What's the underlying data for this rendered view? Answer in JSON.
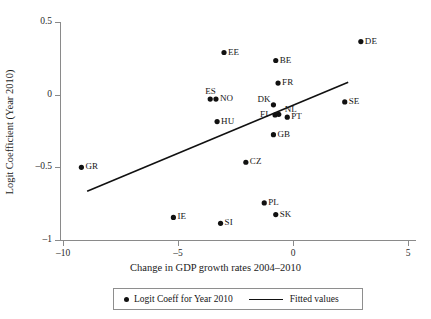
{
  "chart_data": {
    "type": "scatter",
    "title": "",
    "xlabel": "Change in GDP growth rates 2004–2010",
    "ylabel": "Logit Coefficient (Year 2010)",
    "xlim": [
      -10.8,
      5.5
    ],
    "ylim": [
      -1.06,
      0.58
    ],
    "xticks": [
      -10,
      -5,
      0,
      5
    ],
    "xticklabels": [
      "–10",
      "–5",
      "0",
      "5"
    ],
    "yticks": [
      0.5,
      0,
      -0.5,
      -1
    ],
    "yticklabels": [
      "0.5",
      "0",
      "–0.5",
      "–1"
    ],
    "grid": false,
    "legend_position": "below-axes",
    "series": [
      {
        "name": "Logit Coeff for Year 2010",
        "type": "scatter",
        "marker": "filled-circle",
        "color": "#111111",
        "points": [
          {
            "label": "DE",
            "x": 2.95,
            "y": 0.365,
            "label_side": "right"
          },
          {
            "label": "EE",
            "x": -3.0,
            "y": 0.29,
            "label_side": "right"
          },
          {
            "label": "BE",
            "x": -0.75,
            "y": 0.235,
            "label_side": "right"
          },
          {
            "label": "FR",
            "x": -0.65,
            "y": 0.08,
            "label_side": "right"
          },
          {
            "label": "ES",
            "x": -3.6,
            "y": -0.03,
            "label_side": "above"
          },
          {
            "label": "NO",
            "x": -3.35,
            "y": -0.03,
            "label_side": "right"
          },
          {
            "label": "DK",
            "x": -0.85,
            "y": -0.07,
            "label_side": "above-left"
          },
          {
            "label": "SE",
            "x": 2.25,
            "y": -0.05,
            "label_side": "right"
          },
          {
            "label": "NL",
            "x": -0.62,
            "y": -0.135,
            "label_side": "above-right"
          },
          {
            "label": "FI",
            "x": -0.78,
            "y": -0.14,
            "label_side": "left"
          },
          {
            "label": "PT",
            "x": -0.25,
            "y": -0.155,
            "label_side": "right"
          },
          {
            "label": "HU",
            "x": -3.3,
            "y": -0.185,
            "label_side": "right"
          },
          {
            "label": "GB",
            "x": -0.85,
            "y": -0.275,
            "label_side": "right"
          },
          {
            "label": "GR",
            "x": -9.2,
            "y": -0.5,
            "label_side": "right"
          },
          {
            "label": "CZ",
            "x": -2.05,
            "y": -0.465,
            "label_side": "right"
          },
          {
            "label": "PL",
            "x": -1.25,
            "y": -0.745,
            "label_side": "right"
          },
          {
            "label": "SK",
            "x": -0.75,
            "y": -0.825,
            "label_side": "right"
          },
          {
            "label": "IE",
            "x": -5.2,
            "y": -0.845,
            "label_side": "right"
          },
          {
            "label": "SI",
            "x": -3.15,
            "y": -0.885,
            "label_side": "right"
          }
        ]
      },
      {
        "name": "Fitted values",
        "type": "line",
        "color": "#111111",
        "endpoints": [
          {
            "x": -8.95,
            "y": -0.665
          },
          {
            "x": 2.4,
            "y": 0.085
          }
        ]
      }
    ]
  },
  "legend": {
    "items": [
      {
        "label": "Logit Coeff for Year 2010",
        "marker": "filled-circle"
      },
      {
        "label": "Fitted values",
        "marker": "line"
      }
    ]
  }
}
